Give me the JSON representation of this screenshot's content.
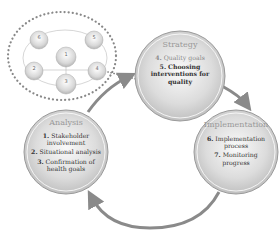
{
  "diagram": {
    "type": "cycle",
    "mini_diagram": {
      "nodes": [
        {
          "num": "1"
        },
        {
          "num": "2"
        },
        {
          "num": "3"
        },
        {
          "num": "4"
        },
        {
          "num": "5"
        },
        {
          "num": "6"
        }
      ]
    },
    "phases": [
      {
        "title": "Strategy",
        "steps": [
          {
            "num": "4.",
            "label": "Quality goals",
            "muted": true
          },
          {
            "num": "5.",
            "label": "Choosing interventions for quality"
          }
        ]
      },
      {
        "title": "Implementation",
        "steps": [
          {
            "num": "6.",
            "label": "Implementation process"
          },
          {
            "num": "7.",
            "label": "Monitoring progress"
          }
        ]
      },
      {
        "title": "Analysis",
        "steps": [
          {
            "num": "1.",
            "label": "Stakeholder involvement"
          },
          {
            "num": "2.",
            "label": "Situational analysis"
          },
          {
            "num": "3.",
            "label": "Confirmation of health goals"
          }
        ]
      }
    ],
    "colors": {
      "circle_fill": "#d6d6d6",
      "circle_stroke": "#9a9a9a",
      "arrow": "#8a8a8a",
      "dots": "#888888"
    }
  }
}
